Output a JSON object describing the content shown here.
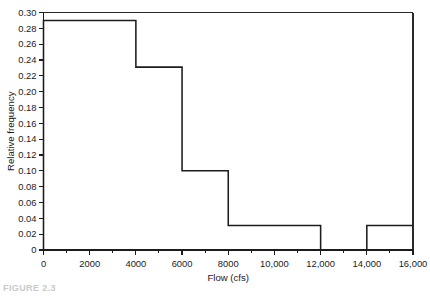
{
  "figure": {
    "caption": "FIGURE 2.3",
    "background_color": "#ffffff",
    "line_color": "#1c1c1c"
  },
  "chart_data": {
    "type": "bar",
    "subtype": "histogram",
    "title": "",
    "xlabel": "Flow (cfs)",
    "ylabel": "Relative frequency",
    "xlim": [
      0,
      16000
    ],
    "ylim": [
      0,
      0.3
    ],
    "grid": false,
    "legend": null,
    "bin_width": 2000,
    "bin_edges": [
      0,
      2000,
      4000,
      6000,
      8000,
      10000,
      12000,
      14000,
      16000
    ],
    "categories": [
      "0-2000",
      "2000-4000",
      "4000-6000",
      "6000-8000",
      "8000-10,000",
      "10,000-12,000",
      "12,000-14,000",
      "14,000-16,000"
    ],
    "values": [
      0.29,
      0.29,
      0.231,
      0.1,
      0.031,
      0.031,
      0.0,
      0.031
    ],
    "x_ticks": [
      0,
      2000,
      4000,
      6000,
      8000,
      10000,
      12000,
      14000,
      16000
    ],
    "x_tick_labels": [
      "0",
      "2000",
      "4000",
      "6000",
      "8000",
      "10,000",
      "12,000",
      "14,000",
      "16,000"
    ],
    "x_minor_tick_interval": 1000,
    "y_ticks": [
      0,
      0.02,
      0.04,
      0.06,
      0.08,
      0.1,
      0.12,
      0.14,
      0.16,
      0.18,
      0.2,
      0.22,
      0.24,
      0.26,
      0.28,
      0.3
    ],
    "y_tick_labels": [
      "0",
      "0.02",
      "0.04",
      "0.06",
      "0.08",
      "0.10",
      "0.12",
      "0.14",
      "0.16",
      "0.18",
      "0.20",
      "0.22",
      "0.24",
      "0.26",
      "0.28",
      "0.30"
    ]
  }
}
